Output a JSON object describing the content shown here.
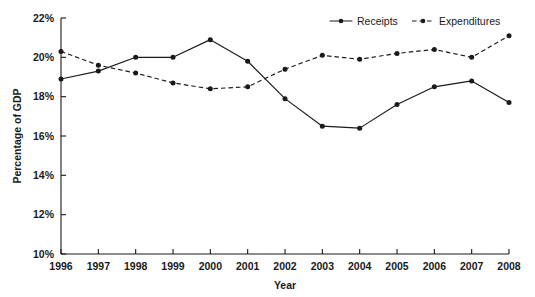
{
  "chart_data": {
    "type": "line",
    "title": "",
    "xlabel": "Year",
    "ylabel": "Percentage of GDP",
    "categories": [
      "1996",
      "1997",
      "1998",
      "1999",
      "2000",
      "2001",
      "2002",
      "2003",
      "2004",
      "2005",
      "2006",
      "2007",
      "2008"
    ],
    "x": [
      1996,
      1997,
      1998,
      1999,
      2000,
      2001,
      2002,
      2003,
      2004,
      2005,
      2006,
      2007,
      2008
    ],
    "xlim": [
      1996,
      2008
    ],
    "ylim": [
      10,
      22
    ],
    "y_tick_labels": [
      "22%",
      "20%",
      "18%",
      "16%",
      "14%",
      "12%",
      "10%"
    ],
    "y_tick_values": [
      22,
      20,
      18,
      16,
      14,
      12,
      10
    ],
    "x_tick_labels": [
      "1996",
      "1997",
      "1998",
      "1999",
      "2000",
      "2001",
      "2002",
      "2003",
      "2004",
      "2005",
      "2006",
      "2007",
      "2008"
    ],
    "grid": false,
    "legend_position": "top-right",
    "series": [
      {
        "name": "Receipts",
        "style": "solid",
        "marker": "circle",
        "color": "#1a1a1a",
        "values": [
          18.9,
          19.3,
          20.0,
          20.0,
          20.9,
          19.8,
          17.9,
          16.5,
          16.4,
          17.6,
          18.5,
          18.8,
          17.7
        ]
      },
      {
        "name": "Expenditures",
        "style": "dashed",
        "marker": "circle",
        "color": "#1a1a1a",
        "values": [
          20.3,
          19.6,
          19.2,
          18.7,
          18.4,
          18.5,
          19.4,
          20.1,
          19.9,
          20.2,
          20.4,
          20.0,
          21.1
        ]
      }
    ]
  },
  "legend": {
    "items": [
      {
        "label": "Receipts"
      },
      {
        "label": "Expenditures"
      }
    ]
  },
  "axes": {
    "y_title": "Percentage of GDP",
    "x_title": "Year"
  }
}
